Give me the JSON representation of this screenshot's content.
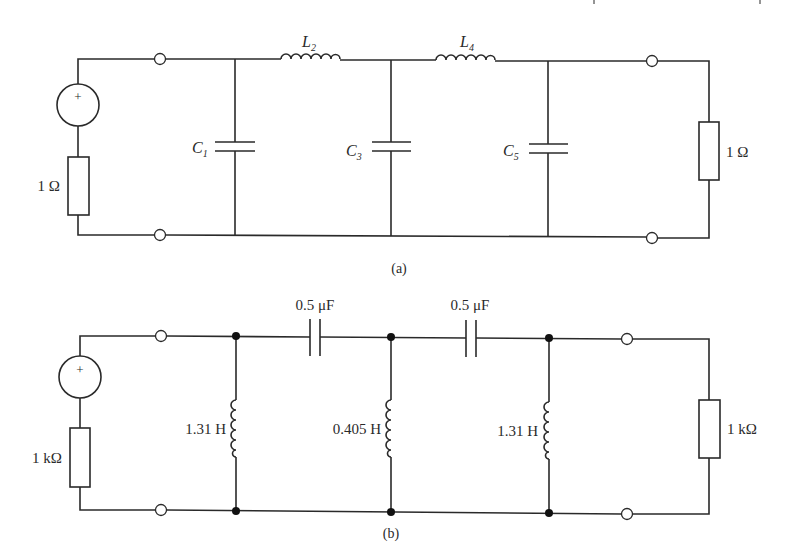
{
  "figure_a": {
    "caption": "(a)",
    "source_resistor": "1 Ω",
    "load_resistor": "1 Ω",
    "components": {
      "C1": {
        "letter": "C",
        "sub": "1"
      },
      "L2": {
        "letter": "L",
        "sub": "2"
      },
      "C3": {
        "letter": "C",
        "sub": "3"
      },
      "L4": {
        "letter": "L",
        "sub": "4"
      },
      "C5": {
        "letter": "C",
        "sub": "5"
      }
    },
    "source_sign": "+"
  },
  "figure_b": {
    "caption": "(b)",
    "source_resistor": "1 kΩ",
    "load_resistor": "1 kΩ",
    "series_cap_1": "0.5 μF",
    "series_cap_2": "0.5 μF",
    "shunt_ind_1": "1.31 H",
    "shunt_ind_2": "0.405 H",
    "shunt_ind_3": "1.31 H",
    "source_sign": "+"
  }
}
